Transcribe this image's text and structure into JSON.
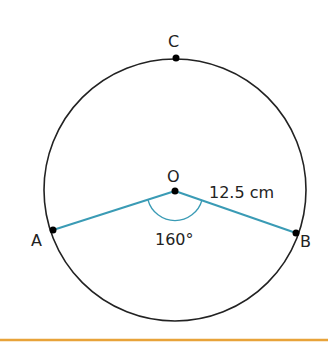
{
  "diagram": {
    "points": {
      "C": "C",
      "O": "O",
      "A": "A",
      "B": "B"
    },
    "radius_label": "12.5 cm",
    "angle_label": "160°",
    "colors": {
      "circle": "#222222",
      "radius": "#3a9bb5",
      "rule": "#e8a33a"
    }
  }
}
